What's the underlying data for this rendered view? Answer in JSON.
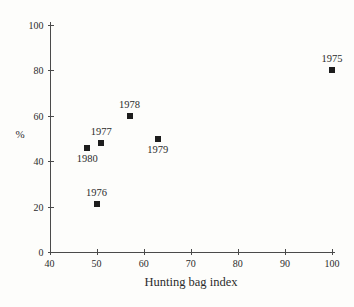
{
  "chart_data": {
    "type": "scatter",
    "title": "",
    "xlabel": "Hunting bag index",
    "ylabel": "%",
    "xlim": [
      40,
      100
    ],
    "ylim": [
      0,
      100
    ],
    "x_ticks": [
      40,
      50,
      60,
      70,
      80,
      90,
      100
    ],
    "y_ticks": [
      0,
      20,
      40,
      60,
      80,
      100
    ],
    "grid": false,
    "legend": null,
    "marker": "filled-square",
    "points": [
      {
        "label": "1975",
        "x": 100,
        "y": 80,
        "label_position": "above"
      },
      {
        "label": "1976",
        "x": 50,
        "y": 21,
        "label_position": "above"
      },
      {
        "label": "1977",
        "x": 51,
        "y": 48,
        "label_position": "above"
      },
      {
        "label": "1978",
        "x": 57,
        "y": 60,
        "label_position": "above"
      },
      {
        "label": "1979",
        "x": 63,
        "y": 50,
        "label_position": "below"
      },
      {
        "label": "1980",
        "x": 48,
        "y": 46,
        "label_position": "below"
      }
    ]
  },
  "colors": {
    "background": "#fdfdfb",
    "ink": "#2b2b2b",
    "marker": "#1d1d1d",
    "axis": "#4a4a4a"
  }
}
